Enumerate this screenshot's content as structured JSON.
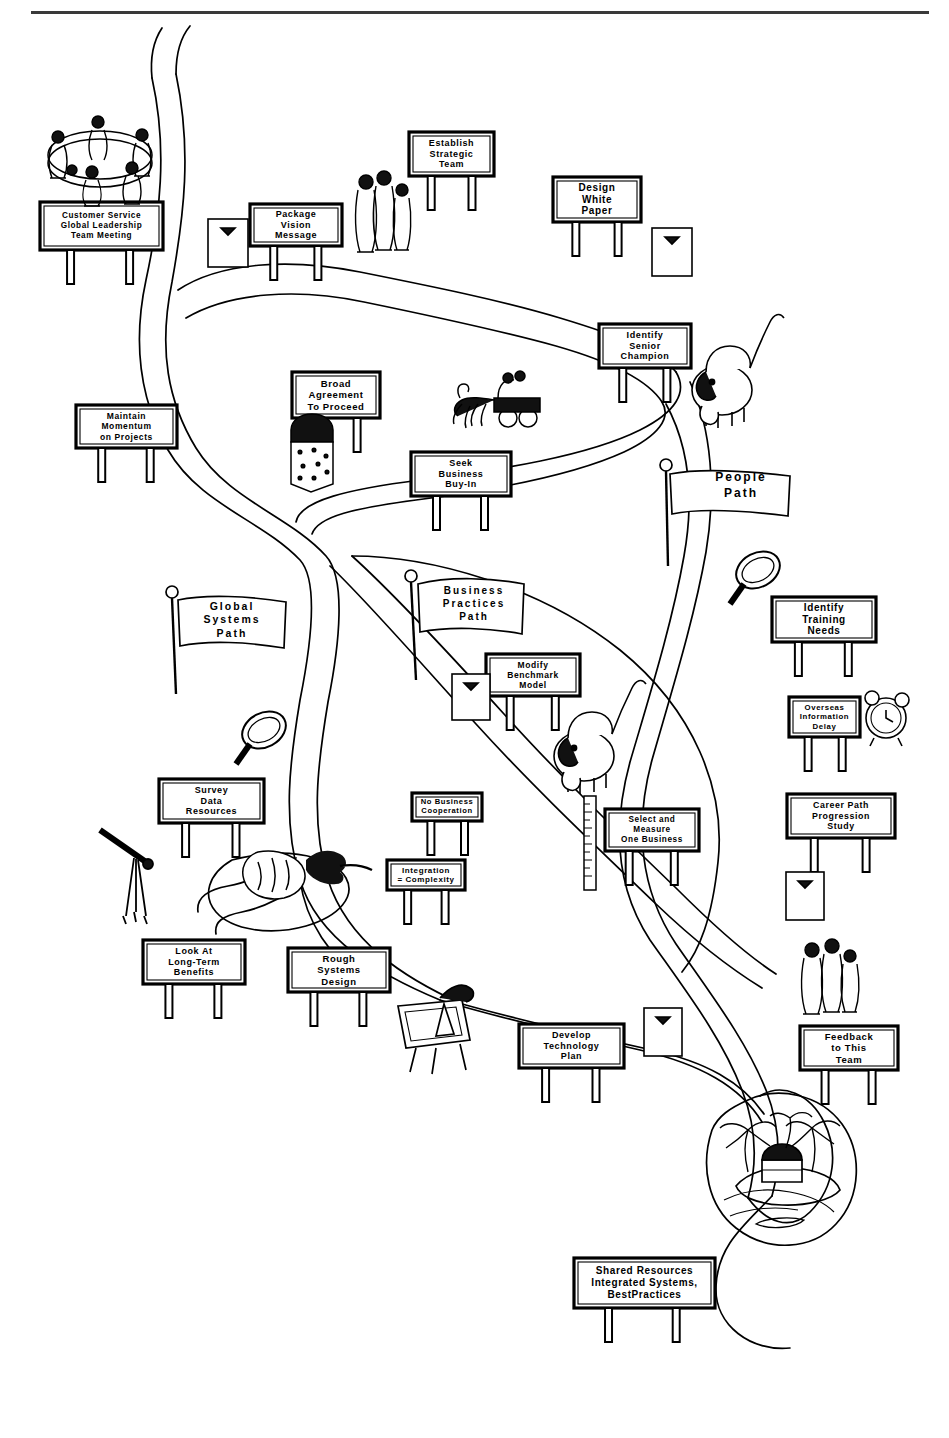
{
  "diagram": {
    "style": "hand-drawn cartoon roadmap with billboards, flags and vignettes",
    "background_color": "#ffffff",
    "ink_color": "#000000",
    "top_rule_color": "#3a3a3a"
  },
  "billboards": [
    {
      "id": "customer-service-global-leadership-team-meeting",
      "lines": [
        "Customer Service",
        "Global Leadership",
        "Team Meeting"
      ],
      "x": 40,
      "y": 202,
      "w": 123,
      "h": 48,
      "font": 8.2
    },
    {
      "id": "package-vision-message",
      "lines": [
        "Package",
        "Vision",
        "Message"
      ],
      "x": 250,
      "y": 204,
      "w": 92,
      "h": 42,
      "font": 9
    },
    {
      "id": "establish-strategic-team",
      "lines": [
        "Establish",
        "Strategic",
        "Team"
      ],
      "x": 409,
      "y": 132,
      "w": 85,
      "h": 44,
      "font": 9
    },
    {
      "id": "design-white-paper",
      "lines": [
        "Design",
        "White",
        "Paper"
      ],
      "x": 553,
      "y": 177,
      "w": 88,
      "h": 45,
      "font": 10
    },
    {
      "id": "identify-senior-champion",
      "lines": [
        "Identify",
        "Senior",
        "Champion"
      ],
      "x": 599,
      "y": 324,
      "w": 92,
      "h": 44,
      "font": 9
    },
    {
      "id": "maintain-momentum-on-projects",
      "lines": [
        "Maintain",
        "Momentum",
        "on Projects"
      ],
      "x": 76,
      "y": 405,
      "w": 101,
      "h": 43,
      "font": 8.5
    },
    {
      "id": "broad-agreement-to-proceed",
      "lines": [
        "Broad",
        "Agreement",
        "To Proceed"
      ],
      "x": 292,
      "y": 372,
      "w": 88,
      "h": 46,
      "font": 9.5
    },
    {
      "id": "seek-business-buy-in",
      "lines": [
        "Seek",
        "Business",
        "Buy-In"
      ],
      "x": 411,
      "y": 452,
      "w": 100,
      "h": 44,
      "font": 9
    },
    {
      "id": "identify-training-needs",
      "lines": [
        "Identify",
        "Training",
        "Needs"
      ],
      "x": 772,
      "y": 597,
      "w": 104,
      "h": 45,
      "font": 10
    },
    {
      "id": "overseas-information-delay",
      "lines": [
        "Overseas",
        "Information",
        "Delay"
      ],
      "x": 789,
      "y": 697,
      "w": 71,
      "h": 40,
      "font": 7.8
    },
    {
      "id": "modify-benchmark-model",
      "lines": [
        "Modify",
        "Benchmark",
        "Model"
      ],
      "x": 486,
      "y": 654,
      "w": 94,
      "h": 42,
      "font": 8.5
    },
    {
      "id": "survey-data-resources",
      "lines": [
        "Survey",
        "Data",
        "Resources"
      ],
      "x": 159,
      "y": 779,
      "w": 105,
      "h": 44,
      "font": 9
    },
    {
      "id": "no-business-cooperation",
      "lines": [
        "No Business",
        "Cooperation"
      ],
      "x": 412,
      "y": 793,
      "w": 70,
      "h": 28,
      "font": 7.6
    },
    {
      "id": "integration-equals-complexity",
      "lines": [
        "Integration",
        "= Complexity"
      ],
      "x": 387,
      "y": 860,
      "w": 78,
      "h": 30,
      "font": 8
    },
    {
      "id": "select-and-measure-one-business",
      "lines": [
        "Select and",
        "Measure",
        "One Business"
      ],
      "x": 605,
      "y": 809,
      "w": 94,
      "h": 42,
      "font": 8.2
    },
    {
      "id": "career-path-progression-study",
      "lines": [
        "Career Path",
        "Progression",
        "Study"
      ],
      "x": 787,
      "y": 794,
      "w": 108,
      "h": 44,
      "font": 8.8
    },
    {
      "id": "look-at-long-term-benefits",
      "lines": [
        "Look At",
        "Long-Term",
        "Benefits"
      ],
      "x": 143,
      "y": 940,
      "w": 102,
      "h": 44,
      "font": 9
    },
    {
      "id": "rough-systems-design",
      "lines": [
        "Rough",
        "Systems",
        "Design"
      ],
      "x": 288,
      "y": 948,
      "w": 102,
      "h": 44,
      "font": 9.5
    },
    {
      "id": "develop-technology-plan",
      "lines": [
        "Develop",
        "Technology",
        "Plan"
      ],
      "x": 519,
      "y": 1024,
      "w": 105,
      "h": 44,
      "font": 9
    },
    {
      "id": "feedback-to-this-team",
      "lines": [
        "Feedback",
        "to This",
        "Team"
      ],
      "x": 800,
      "y": 1026,
      "w": 98,
      "h": 44,
      "font": 9.5
    },
    {
      "id": "shared-resources-integrated-systems-bestpractices",
      "lines": [
        "Shared Resources",
        "Integrated Systems,",
        "BestPractices"
      ],
      "x": 574,
      "y": 1258,
      "w": 141,
      "h": 50,
      "font": 10
    }
  ],
  "flags": [
    {
      "id": "people-path",
      "lines": [
        "People",
        "Path"
      ],
      "x": 693,
      "y": 466,
      "w": 96,
      "h": 40,
      "font": 12
    },
    {
      "id": "global-systems-path",
      "lines": [
        "Global",
        "Systems",
        "Path"
      ],
      "x": 185,
      "y": 597,
      "w": 94,
      "h": 46,
      "font": 10.5
    },
    {
      "id": "business-practices-path",
      "lines": [
        "Business",
        "Practices",
        "Path"
      ],
      "x": 424,
      "y": 580,
      "w": 100,
      "h": 46,
      "font": 10
    }
  ],
  "vignettes": [
    {
      "id": "round-table-meeting-scene",
      "label": "people seated around a round conference table"
    },
    {
      "id": "standing-group-top",
      "label": "small group of people standing"
    },
    {
      "id": "standing-group-bottom-right",
      "label": "small group of people standing"
    },
    {
      "id": "elephant-top-right",
      "label": "cartoon elephant with raised trunk"
    },
    {
      "id": "elephant-center",
      "label": "cartoon elephant with raised trunk"
    },
    {
      "id": "horse-and-carriage",
      "label": "horse drawn carriage with riders"
    },
    {
      "id": "brick-pillar",
      "label": "stone brick pillar post"
    },
    {
      "id": "magnifying-glass-right",
      "label": "magnifying glass"
    },
    {
      "id": "magnifying-glass-left",
      "label": "magnifying glass"
    },
    {
      "id": "alarm-clock",
      "label": "ringing alarm clock"
    },
    {
      "id": "ruler",
      "label": "measuring ruler"
    },
    {
      "id": "surveyors-tripod",
      "label": "surveyor transit on tripod"
    },
    {
      "id": "tree-stump-rock",
      "label": "rock and brush obstacle"
    },
    {
      "id": "drafting-easel",
      "label": "drafting board on easel"
    },
    {
      "id": "treasure-island",
      "label": "palm tree island with treasure chest"
    },
    {
      "id": "blank-notice-board",
      "label": "blank posted notice board"
    }
  ],
  "roads": {
    "description": "winding two-lane roads branching from the start at top left into three named paths that converge at the treasure island destination",
    "paths": [
      "People Path",
      "Global Systems Path",
      "Business Practices Path"
    ]
  }
}
